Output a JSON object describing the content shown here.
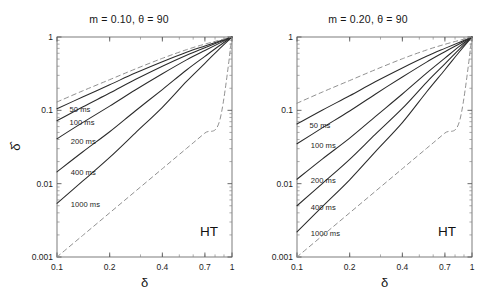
{
  "figure": {
    "background": "#ffffff",
    "ink": "#2a2a2a",
    "dash_color": "#8a8a8a"
  },
  "axes": {
    "x_label": "δ",
    "y_label": "δ̂",
    "x_ticks": [
      "0.1",
      "0.2",
      "0.4",
      "0.7",
      "1"
    ],
    "x_tick_values": [
      0.1,
      0.2,
      0.4,
      0.7,
      1
    ],
    "y_ticks": [
      "0.001",
      "0.01",
      "0.1",
      "1"
    ],
    "y_tick_values": [
      0.001,
      0.01,
      0.1,
      1
    ],
    "xlim": [
      0.1,
      1
    ],
    "ylim": [
      0.001,
      1
    ],
    "xscale": "log",
    "yscale": "log"
  },
  "panels": [
    {
      "id": "left",
      "title": "m = 0.10, θ = 90",
      "m": "0.10",
      "theta": "90",
      "corner_tag": "HT",
      "curve_labels": [
        "50 ms",
        "100 ms",
        "200 ms",
        "400 ms",
        "1000 ms"
      ]
    },
    {
      "id": "right",
      "title": "m = 0.20, θ = 90",
      "m": "0.20",
      "theta": "90",
      "corner_tag": "HT",
      "curve_labels": [
        "50 ms",
        "100 ms",
        "200 ms",
        "400 ms",
        "1000 ms"
      ]
    }
  ],
  "chart_data": [
    {
      "type": "line",
      "id": "left-panel",
      "title": "m = 0.10, θ = 90",
      "xlabel": "δ",
      "ylabel": "δ̂",
      "xscale": "log",
      "yscale": "log",
      "xlim": [
        0.1,
        1.0
      ],
      "ylim": [
        0.001,
        1.0
      ],
      "grid": false,
      "legend": "inline-curve-labels",
      "annotations": [
        {
          "text": "HT",
          "x": 0.66,
          "y": 0.0023
        }
      ],
      "x": [
        0.1,
        0.14,
        0.2,
        0.28,
        0.4,
        0.55,
        0.7,
        0.85,
        1.0
      ],
      "series": [
        {
          "name": "50 ms",
          "style": "solid",
          "values": [
            0.105,
            0.152,
            0.223,
            0.322,
            0.46,
            0.62,
            0.755,
            0.88,
            1.0
          ]
        },
        {
          "name": "100 ms",
          "style": "solid",
          "values": [
            0.072,
            0.111,
            0.172,
            0.263,
            0.4,
            0.565,
            0.715,
            0.86,
            1.0
          ]
        },
        {
          "name": "200 ms",
          "style": "solid",
          "values": [
            0.041,
            0.068,
            0.114,
            0.189,
            0.315,
            0.487,
            0.655,
            0.825,
            1.0
          ]
        },
        {
          "name": "400 ms",
          "style": "solid",
          "values": [
            0.0145,
            0.027,
            0.051,
            0.098,
            0.192,
            0.355,
            0.545,
            0.765,
            1.0
          ]
        },
        {
          "name": "1000 ms",
          "style": "solid",
          "values": [
            0.0054,
            0.0108,
            0.0228,
            0.049,
            0.11,
            0.248,
            0.437,
            0.695,
            1.0
          ]
        },
        {
          "name": "upper-bound",
          "style": "dashed",
          "values": [
            0.13,
            0.184,
            0.262,
            0.366,
            0.512,
            0.672,
            0.8,
            0.905,
            1.0
          ]
        },
        {
          "name": "lower-bound",
          "style": "dashed",
          "values": [
            0.001,
            0.00196,
            0.004,
            0.00784,
            0.016,
            0.03025,
            0.049,
            0.07225,
            1.0
          ]
        }
      ],
      "curve_label_positions": [
        {
          "name": "50 ms",
          "x": 0.118,
          "y": 0.104
        },
        {
          "name": "100 ms",
          "x": 0.118,
          "y": 0.07
        },
        {
          "name": "200 ms",
          "x": 0.12,
          "y": 0.0385
        },
        {
          "name": "400 ms",
          "x": 0.12,
          "y": 0.0142
        },
        {
          "name": "1000 ms",
          "x": 0.12,
          "y": 0.0053
        }
      ]
    },
    {
      "type": "line",
      "id": "right-panel",
      "title": "m = 0.20, θ = 90",
      "xlabel": "δ",
      "ylabel": "δ̂",
      "xscale": "log",
      "yscale": "log",
      "xlim": [
        0.1,
        1.0
      ],
      "ylim": [
        0.001,
        1.0
      ],
      "grid": false,
      "legend": "inline-curve-labels",
      "annotations": [
        {
          "text": "HT",
          "x": 0.66,
          "y": 0.0023
        }
      ],
      "x": [
        0.1,
        0.14,
        0.2,
        0.28,
        0.4,
        0.55,
        0.7,
        0.85,
        1.0
      ],
      "series": [
        {
          "name": "50 ms",
          "style": "solid",
          "values": [
            0.065,
            0.101,
            0.158,
            0.245,
            0.378,
            0.545,
            0.7,
            0.85,
            1.0
          ]
        },
        {
          "name": "100 ms",
          "style": "solid",
          "values": [
            0.035,
            0.058,
            0.098,
            0.166,
            0.285,
            0.455,
            0.63,
            0.81,
            1.0
          ]
        },
        {
          "name": "200 ms",
          "style": "solid",
          "values": [
            0.0115,
            0.0218,
            0.0418,
            0.082,
            0.167,
            0.322,
            0.515,
            0.75,
            1.0
          ]
        },
        {
          "name": "400 ms",
          "style": "solid",
          "values": [
            0.005,
            0.0101,
            0.0215,
            0.047,
            0.106,
            0.241,
            0.43,
            0.69,
            1.0
          ]
        },
        {
          "name": "1000 ms",
          "style": "solid",
          "values": [
            0.0022,
            0.0049,
            0.0113,
            0.0272,
            0.068,
            0.178,
            0.358,
            0.635,
            1.0
          ]
        },
        {
          "name": "upper-bound",
          "style": "dashed",
          "values": [
            0.125,
            0.178,
            0.255,
            0.358,
            0.505,
            0.665,
            0.795,
            0.902,
            1.0
          ]
        },
        {
          "name": "lower-bound",
          "style": "dashed",
          "values": [
            0.001,
            0.00196,
            0.004,
            0.00784,
            0.016,
            0.03025,
            0.049,
            0.07225,
            1.0
          ]
        }
      ],
      "curve_label_positions": [
        {
          "name": "50 ms",
          "x": 0.118,
          "y": 0.063
        },
        {
          "name": "100 ms",
          "x": 0.12,
          "y": 0.0335
        },
        {
          "name": "200 ms",
          "x": 0.12,
          "y": 0.0112
        },
        {
          "name": "400 ms",
          "x": 0.12,
          "y": 0.00485
        },
        {
          "name": "1000 ms",
          "x": 0.12,
          "y": 0.00215
        }
      ]
    }
  ]
}
